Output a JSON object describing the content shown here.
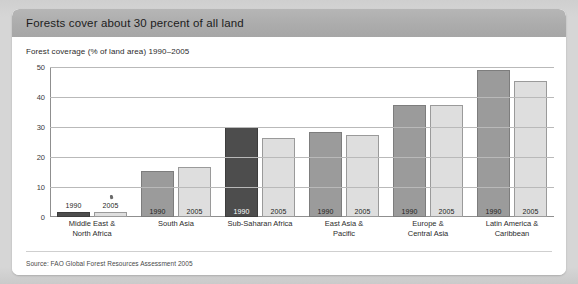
{
  "card": {
    "header_title": "Forests cover about 30 percent of all land",
    "subtitle": "Forest coverage (% of land area) 1990–2005",
    "source": "Source: FAO Global Forest Resources Assessment 2005"
  },
  "colors": {
    "page_background": "#d6d6d6",
    "card_background": "#ffffff",
    "header_background": "#acacac",
    "bar_dark": "#4d4d4d",
    "bar_medium": "#9b9b9b",
    "bar_light": "#dedede",
    "gridline": "#b9b9b9",
    "axis": "#8f8f8f"
  },
  "chart_data": {
    "type": "bar",
    "title": "Forest coverage (% of land area) 1990–2005",
    "xlabel": "",
    "ylabel": "",
    "ylim": [
      0,
      50
    ],
    "yticks": [
      0,
      10,
      20,
      30,
      40,
      50
    ],
    "grid": true,
    "legend": "none",
    "categories": [
      "Middle East &\nNorth Africa",
      "South Asia",
      "Sub-Saharan Africa",
      "East Asia &\nPacific",
      "Europe &\nCentral Asia",
      "Latin America &\nCaribbean"
    ],
    "series": [
      {
        "name": "1990",
        "values": [
          1.8,
          15.5,
          30.0,
          28.3,
          37.5,
          49.0
        ]
      },
      {
        "name": "2005",
        "values": [
          1.8,
          16.8,
          26.5,
          27.3,
          37.5,
          45.5
        ]
      }
    ],
    "bar_shades": [
      [
        "dark",
        "light"
      ],
      [
        "medium",
        "light"
      ],
      [
        "dark",
        "light"
      ],
      [
        "medium",
        "light"
      ],
      [
        "medium",
        "light"
      ],
      [
        "medium",
        "light"
      ]
    ],
    "highlight_note": "Sub-Saharan Africa 1990 bar is emphasised in dark grey at the 30% gridline"
  }
}
